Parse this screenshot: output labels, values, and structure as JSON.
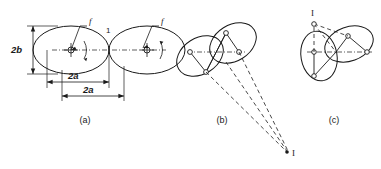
{
  "figure": {
    "background_color": "#ffffff",
    "line_color": "#1a1a1a"
  },
  "panels": [
    {
      "id": "a",
      "caption": "(a)",
      "labels": {
        "height_dim": "2b",
        "width_dim_upper": "2a",
        "width_dim_lower": "2a",
        "friction_left": "f",
        "friction_right": "f",
        "contact_point": "1"
      }
    },
    {
      "id": "b",
      "caption": "(b)",
      "labels": {
        "instant_center": "I"
      }
    },
    {
      "id": "c",
      "caption": "(c)",
      "labels": {
        "instant_center": "I"
      }
    }
  ]
}
